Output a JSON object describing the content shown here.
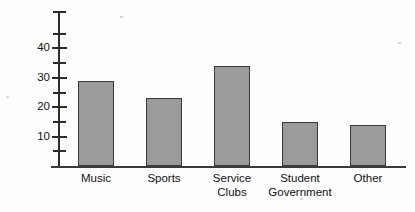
{
  "chart_data": {
    "type": "bar",
    "title": "",
    "xlabel": "",
    "ylabel": "Number of Students",
    "categories": [
      "Music",
      "Sports",
      "Service Clubs",
      "Student Government",
      "Other"
    ],
    "category_lines": [
      [
        "Music"
      ],
      [
        "Sports"
      ],
      [
        "Service",
        "Clubs"
      ],
      [
        "Student",
        "Government"
      ],
      [
        "Other"
      ]
    ],
    "values": [
      29,
      23,
      34,
      15,
      14
    ],
    "ylim": [
      0,
      47
    ],
    "ytick_labels": [
      "10",
      "20",
      "30",
      "40"
    ],
    "ytick_values": [
      10,
      20,
      30,
      40
    ],
    "minor_tick_values": [
      5,
      15,
      25,
      35,
      45
    ],
    "grid": false,
    "legend": false,
    "bar_fill_color": "#9b9b9b",
    "bar_border_color": "#3a3a3a",
    "axis_color": "#2b2b2b",
    "background_color": "#fefefe",
    "text_color": "#111111"
  }
}
